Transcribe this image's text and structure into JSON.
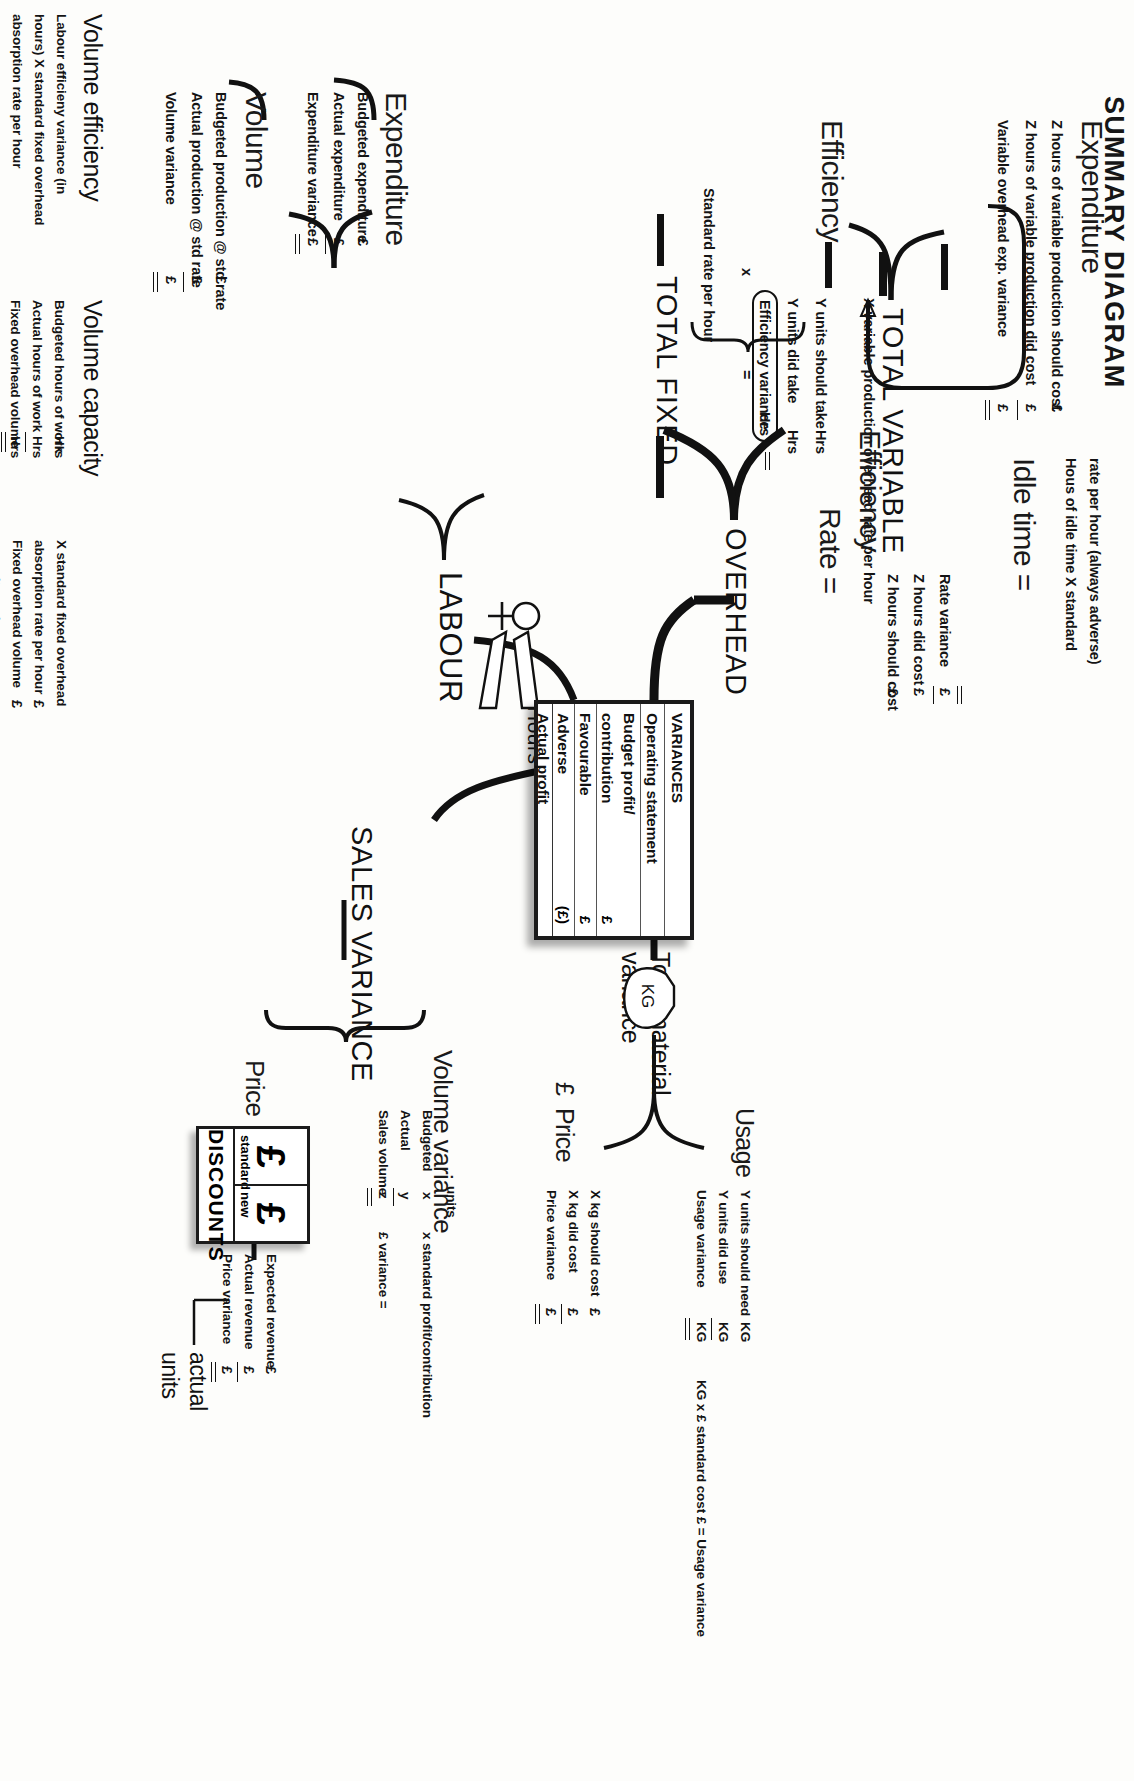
{
  "title": "SUMMARY DIAGRAM",
  "spine": {
    "total_variable": "TOTAL VARIABLE",
    "overhead": "OVERHEAD",
    "total_fixed": "TOTAL FIXED",
    "labour": "LABOUR",
    "sales_variance": "SALES VARIANCE",
    "total_material_variance_l1": "Total material",
    "total_material_variance_l2": "variance"
  },
  "variable_overhead": {
    "expenditure": {
      "heading": "Expenditure",
      "lines": [
        {
          "label": "Z hours of variable production should cost",
          "amount": "£"
        },
        {
          "label": "Z hours of variable production did cost",
          "amount": "£"
        },
        {
          "label": "Variable overhead exp. variance",
          "amount": "£"
        }
      ]
    },
    "efficiency": {
      "heading": "Efficiency",
      "rate_line": "X variable production overhead rate per hour",
      "lines": [
        {
          "label": "Y units should take",
          "unit": "Hrs"
        },
        {
          "label": "Y units did take",
          "unit": "Hrs"
        },
        {
          "label": "Efficiency variance",
          "unit": "Hrs"
        }
      ]
    }
  },
  "labour": {
    "heading": "LABOUR",
    "hours_label": "Hours",
    "efficiency": {
      "heading": "Efficiency",
      "standard_rate": "Standard rate per hour",
      "multiplier": "x",
      "boxed_term": "Efficiency variance",
      "boxed_unit": "Hrs",
      "equals": "="
    },
    "rate": {
      "heading": "Rate =",
      "lines": [
        {
          "label": "Z hours should cost",
          "amount": "£"
        },
        {
          "label": "Z hours did cost",
          "amount": "£"
        },
        {
          "label": "Rate variance",
          "amount": "£"
        }
      ]
    },
    "idle_time": {
      "heading": "Idle time =",
      "line1": "Hous of idle time X standard",
      "line2": "rate per hour (always adverse)"
    }
  },
  "fixed_overhead": {
    "expenditure": {
      "heading": "Expenditure",
      "lines": [
        {
          "label": "Budgeted expenditure",
          "amount": "£"
        },
        {
          "label": "Actual expenditure",
          "amount": "£"
        },
        {
          "label": "Expenditure variance",
          "amount": "£"
        }
      ]
    },
    "volume": {
      "heading": "Volume",
      "lines": [
        {
          "label": "Budgeted production @ std rate",
          "amount": "£"
        },
        {
          "label": "Actual production @ std rate",
          "amount": "£"
        },
        {
          "label": "Volume variance",
          "amount": "£"
        }
      ]
    },
    "volume_efficiency": {
      "heading": "Volume efficiency",
      "note_l1": "Labour efficieny variance (in",
      "note_l2": "hours) X standard fixed overhead",
      "note_l3": "absorption rate per hour"
    },
    "volume_capacity": {
      "heading": "Volume capacity",
      "lines": [
        {
          "label": "Budgeted hours of work",
          "unit": "Hrs"
        },
        {
          "label": "Actual hours of work",
          "unit": "Hrs"
        },
        {
          "label": "Fixed overhead volume",
          "unit": "Hrs"
        },
        {
          "label": "capacity variance",
          "unit": ""
        }
      ],
      "tail_l1": "X standard fixed overhead",
      "tail_l2": "absorption rate per hour",
      "tail_l3": "Fixed overhead volume",
      "tail_l4": "capacity variance",
      "tail_amt1": "£",
      "tail_amt2": "£"
    }
  },
  "material": {
    "heading_l1": "Total material",
    "heading_l2": "variance",
    "bag_label": "KG",
    "usage": {
      "heading": "Usage",
      "lines": [
        {
          "label": "Y units should need",
          "unit": "KG"
        },
        {
          "label": "Y units did use",
          "unit": "KG"
        },
        {
          "label": "Usage variance",
          "unit": "KG"
        }
      ],
      "formula": "KG x £ standard cost £ = Usage variance"
    },
    "price": {
      "heading": "Price",
      "currency": "£",
      "lines": [
        {
          "label": "X kg should cost",
          "amount": "£"
        },
        {
          "label": "X kg did cost",
          "amount": "£"
        },
        {
          "label": "Price variance",
          "amount": "£"
        }
      ]
    }
  },
  "sales": {
    "heading": "SALES VARIANCE",
    "volume": {
      "heading": "Volume variance",
      "units_header": "units",
      "lines": [
        {
          "label": "Budgeted",
          "value": "x"
        },
        {
          "label": "Actual",
          "value": "y"
        },
        {
          "label": "Sales volume",
          "value": "z"
        }
      ],
      "note": "x standard profit/contribution",
      "result": "£ variance ="
    },
    "price": {
      "heading": "Price",
      "discounts": {
        "title": "DISCOUNTS",
        "cells": [
          {
            "symbol": "£",
            "sub": "standard"
          },
          {
            "symbol": "£",
            "sub": "new"
          }
        ]
      },
      "actual_units_l1": "actual",
      "actual_units_l2": "units",
      "lines": [
        {
          "label": "Expected revenue",
          "amount": "£"
        },
        {
          "label": "Actual revenue",
          "amount": "£"
        },
        {
          "label": "Price variance",
          "amount": "£"
        }
      ]
    }
  },
  "variances_table": {
    "header": "VARIANCES",
    "rows": [
      {
        "label": "Operating statement",
        "amount": ""
      },
      {
        "label": "Budget profit/",
        "amount": ""
      },
      {
        "label": "contribution",
        "amount": "£"
      },
      {
        "label": "Favourable",
        "amount": "£"
      },
      {
        "label": "Adverse",
        "amount": "(£)"
      },
      {
        "label": "Actual profit",
        "amount": ""
      }
    ]
  }
}
